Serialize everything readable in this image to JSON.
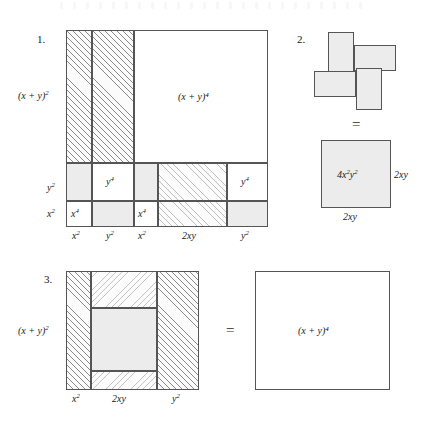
{
  "figure": {
    "equals_sign": "=",
    "panels": [
      {
        "number": "1.",
        "name": "panel-one-decomposition",
        "left_labels": [
          "(x + y)²",
          "y²",
          "x²"
        ],
        "bottom_labels": [
          "x²",
          "y²",
          "x²",
          "2xy",
          "y²"
        ],
        "big_cell_label": "(x + y)⁴",
        "cell_labels": [
          "y⁴",
          "y⁴",
          "x⁴",
          "x⁴"
        ]
      },
      {
        "number": "2.",
        "name": "panel-two-pinwheel",
        "equals": "=",
        "square_label": "4x²y²",
        "side_label_right": "2xy",
        "side_label_bottom": "2xy"
      },
      {
        "number": "3.",
        "name": "panel-three-assembled",
        "left_label": "(x + y)²",
        "bottom_labels": [
          "x²",
          "2xy",
          "y²"
        ],
        "equals": "=",
        "result_label": "(x + y)⁴"
      }
    ]
  },
  "colors": {
    "ink": "#1a1a1a",
    "stroke": "#555555",
    "gray_fill": "#ececec",
    "hatch": "#8a8a8a",
    "paper": "#ffffff"
  }
}
